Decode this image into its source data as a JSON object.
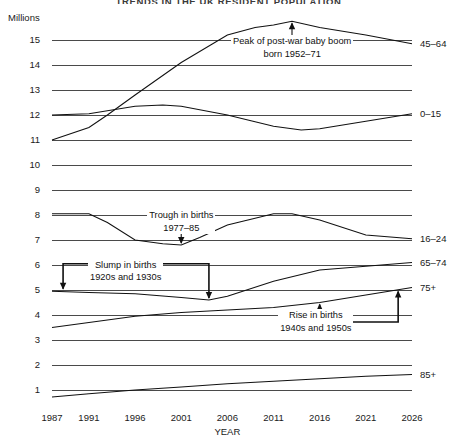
{
  "chart_data": {
    "type": "line",
    "title": "TRENDS IN THE UK RESIDENT POPULATION",
    "ylabel": "Millions",
    "xlabel": "YEAR",
    "ylim": [
      0,
      16
    ],
    "xlim": [
      1987,
      2026
    ],
    "grid": true,
    "legend_position": "right-of-plot",
    "y_ticks": [
      "15",
      "14",
      "13",
      "12",
      "11",
      "10",
      "9",
      "8",
      "7",
      "6",
      "5",
      "4",
      "3",
      "2",
      "1"
    ],
    "y_tick_values": [
      15,
      14,
      13,
      12,
      11,
      10,
      9,
      8,
      7,
      6,
      5,
      4,
      3,
      2,
      1
    ],
    "x_ticks": [
      "1987",
      "1991",
      "1996",
      "2001",
      "2006",
      "2011",
      "2016",
      "2021",
      "2026"
    ],
    "x_tick_values": [
      1987,
      1991,
      1996,
      2001,
      2006,
      2011,
      2016,
      2021,
      2026
    ],
    "series": [
      {
        "name": "45-64",
        "label": "45–64",
        "x": [
          1987,
          1991,
          1993,
          1996,
          2001,
          2006,
          2009,
          2011,
          2013,
          2016,
          2021,
          2026
        ],
        "values": [
          11.0,
          11.5,
          12.0,
          12.8,
          14.1,
          15.2,
          15.5,
          15.6,
          15.75,
          15.5,
          15.2,
          14.85
        ]
      },
      {
        "name": "0-15",
        "label": "0–15",
        "x": [
          1987,
          1991,
          1996,
          1999,
          2001,
          2006,
          2011,
          2014,
          2016,
          2021,
          2026
        ],
        "values": [
          12.0,
          12.05,
          12.35,
          12.4,
          12.35,
          12.0,
          11.55,
          11.4,
          11.45,
          11.75,
          12.05
        ]
      },
      {
        "name": "16-24",
        "label": "16–24",
        "x": [
          1987,
          1991,
          1993,
          1996,
          1999,
          2001,
          2003,
          2006,
          2011,
          2013,
          2016,
          2021,
          2026
        ],
        "values": [
          8.05,
          8.05,
          7.7,
          7.0,
          6.85,
          6.8,
          7.1,
          7.6,
          8.05,
          8.05,
          7.8,
          7.2,
          7.05
        ]
      },
      {
        "name": "65-74",
        "label": "65–74",
        "x": [
          1987,
          1991,
          1996,
          2001,
          2004,
          2006,
          2011,
          2016,
          2021,
          2026
        ],
        "values": [
          4.95,
          4.9,
          4.85,
          4.7,
          4.6,
          4.75,
          5.35,
          5.8,
          5.95,
          6.1
        ]
      },
      {
        "name": "75+",
        "label": "75+",
        "x": [
          1987,
          1991,
          1996,
          2001,
          2006,
          2011,
          2016,
          2021,
          2026
        ],
        "values": [
          3.5,
          3.7,
          3.95,
          4.1,
          4.2,
          4.3,
          4.5,
          4.8,
          5.1
        ]
      },
      {
        "name": "85+",
        "label": "85+",
        "x": [
          1987,
          1991,
          1996,
          2001,
          2006,
          2011,
          2016,
          2021,
          2026
        ],
        "values": [
          0.72,
          0.85,
          1.0,
          1.12,
          1.25,
          1.35,
          1.45,
          1.55,
          1.62
        ]
      }
    ],
    "annotations": [
      {
        "name": "peak-baby-boom",
        "line1": "Peak of post-war baby boom",
        "line2": "born 1952–71",
        "arrow_target_x": 2013,
        "arrow_target_y": 15.75
      },
      {
        "name": "trough-in-births",
        "line1": "Trough in births",
        "line2": "1977–85",
        "arrow_target_x": 2001,
        "arrow_target_y": 6.8
      },
      {
        "name": "slump-in-births",
        "line1": "Slump in births",
        "line2": "1920s and 1930s",
        "arrow_target_x": 2004,
        "arrow_target_y": 4.6
      },
      {
        "name": "rise-in-births",
        "line1": "Rise in births",
        "line2": "1940s and 1950s",
        "arrow_target_x": 2016,
        "arrow_target_y": 4.5
      }
    ]
  },
  "colors": {
    "line": "#111111",
    "grid": "#4a4a4a",
    "text": "#1a1a1a",
    "background": "#ffffff"
  }
}
